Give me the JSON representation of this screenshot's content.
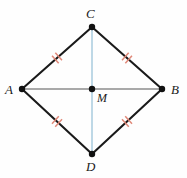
{
  "figure": {
    "type": "geometry-diagram",
    "shape": "rhombus",
    "background_color": "#fefefe",
    "width": 187,
    "height": 178,
    "vertices": [
      {
        "id": "A",
        "label": "A",
        "x": 22,
        "y": 89,
        "dot": true
      },
      {
        "id": "B",
        "label": "B",
        "x": 162,
        "y": 89,
        "dot": true
      },
      {
        "id": "C",
        "label": "C",
        "x": 92,
        "y": 27,
        "dot": true
      },
      {
        "id": "D",
        "label": "D",
        "x": 92,
        "y": 154,
        "dot": true
      }
    ],
    "center": {
      "id": "M",
      "label": "M",
      "x": 92,
      "y": 89,
      "dot": true
    },
    "sides": [
      {
        "id": "AC",
        "from": "A",
        "to": "C",
        "color": "#1a1a1a",
        "tick_marks": 2
      },
      {
        "id": "CB",
        "from": "C",
        "to": "B",
        "color": "#1a1a1a",
        "tick_marks": 2
      },
      {
        "id": "AD",
        "from": "A",
        "to": "D",
        "color": "#1a1a1a",
        "tick_marks": 2
      },
      {
        "id": "DB",
        "from": "D",
        "to": "B",
        "color": "#1a1a1a",
        "tick_marks": 2
      }
    ],
    "diagonals": [
      {
        "id": "AB",
        "from": "A",
        "to": "B",
        "color": "#8c8c8c",
        "orientation": "horizontal"
      },
      {
        "id": "CD",
        "from": "C",
        "to": "D",
        "color": "#aecfe0",
        "orientation": "vertical"
      }
    ],
    "tick_color": "#e08878",
    "dot_color": "#111111"
  },
  "labels": {
    "A": "A",
    "B": "B",
    "C": "C",
    "D": "D",
    "M": "M"
  }
}
